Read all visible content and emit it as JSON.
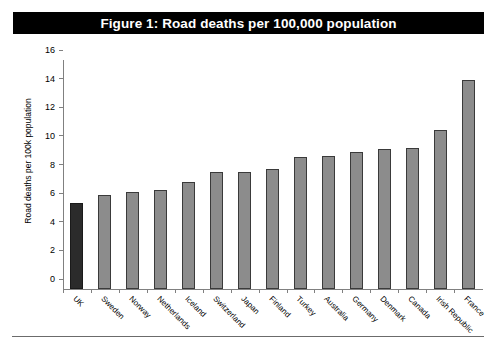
{
  "figure": {
    "title": "Figure 1: Road deaths per 100,000 population",
    "title_background": "#000000",
    "title_color": "#ffffff"
  },
  "chart_data": {
    "type": "bar",
    "title": "Figure 1: Road deaths per 100,000 population",
    "xlabel": "",
    "ylabel": "Road deaths per 100k population",
    "ylim": [
      0,
      16
    ],
    "yticks": [
      0,
      2,
      4,
      6,
      8,
      10,
      12,
      14,
      16
    ],
    "ytick_labels": [
      "0",
      "2",
      "4",
      "6",
      "8",
      "10",
      "12",
      "14",
      "16"
    ],
    "grid": false,
    "legend": false,
    "categories": [
      "UK",
      "Sweden",
      "Norway",
      "Netherlands",
      "Iceland",
      "Switzerland",
      "Japan",
      "Finland",
      "Turkey",
      "Australia",
      "Germany",
      "Denmark",
      "Canada",
      "Irish Republic",
      "France"
    ],
    "values": [
      6.0,
      6.6,
      6.8,
      6.9,
      7.5,
      8.2,
      8.2,
      8.4,
      9.2,
      9.3,
      9.6,
      9.8,
      9.85,
      11.1,
      14.6
    ],
    "highlight_index": 0,
    "bar_color": "#8c8c8c",
    "bar_border_color": "#3a3a3a",
    "highlight_color": "#2b2b2b",
    "axis_color": "#808080"
  }
}
